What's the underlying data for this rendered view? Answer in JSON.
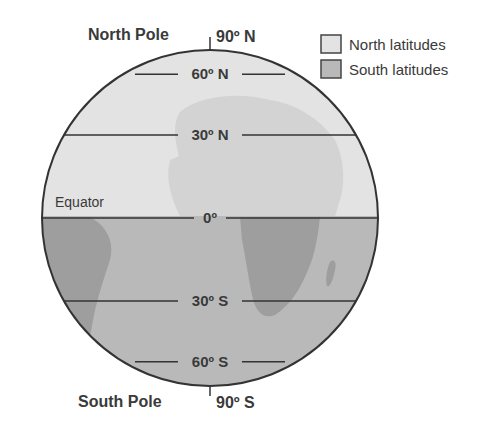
{
  "title_labels": {
    "north_pole": "North Pole",
    "south_pole": "South Pole",
    "equator": "Equator"
  },
  "latitudes": [
    {
      "label": "90º N",
      "deg": 90
    },
    {
      "label": "60º N",
      "deg": 60
    },
    {
      "label": "30º N",
      "deg": 30
    },
    {
      "label": "0º",
      "deg": 0
    },
    {
      "label": "30º S",
      "deg": -30
    },
    {
      "label": "60º S",
      "deg": -60
    },
    {
      "label": "90º S",
      "deg": -90
    }
  ],
  "legend": [
    {
      "label": "North latitudes",
      "color": "#e3e3e3"
    },
    {
      "label": "South latitudes",
      "color": "#b9b9b9"
    }
  ],
  "colors": {
    "north_fill": "#e3e3e3",
    "south_fill": "#b9b9b9",
    "north_land": "#d3d3d3",
    "south_land": "#9e9e9e",
    "outline": "#333333",
    "text": "#3a3a3a"
  }
}
